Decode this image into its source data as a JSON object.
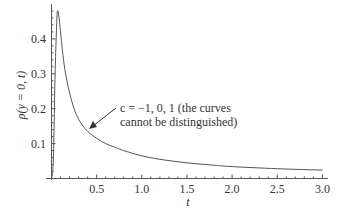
{
  "chart_data": {
    "type": "line",
    "title": "",
    "xlabel": "t",
    "ylabel": "ρ(y = 0, t)",
    "xlim": [
      0,
      3.0
    ],
    "ylim": [
      0,
      0.5
    ],
    "grid": false,
    "legend": null,
    "x_ticks": [
      "0.5",
      "1.0",
      "1.5",
      "2.0",
      "2.5",
      "3.0"
    ],
    "y_ticks": [
      "0.1",
      "0.2",
      "0.3",
      "0.4"
    ],
    "annotation": {
      "line1": "c = −1, 0, 1 (the curves",
      "line2": "cannot be distinguished)",
      "arrow_to": [
        0.4,
        0.14
      ]
    },
    "series": [
      {
        "name": "c = -1, 0, 1",
        "x": [
          0.0,
          0.02,
          0.04,
          0.06,
          0.07,
          0.08,
          0.1,
          0.12,
          0.15,
          0.2,
          0.25,
          0.3,
          0.35,
          0.4,
          0.5,
          0.6,
          0.7,
          0.8,
          1.0,
          1.2,
          1.5,
          1.8,
          2.0,
          2.5,
          3.0
        ],
        "values": [
          0.0,
          0.05,
          0.3,
          0.46,
          0.48,
          0.47,
          0.42,
          0.37,
          0.31,
          0.245,
          0.2,
          0.17,
          0.15,
          0.135,
          0.115,
          0.1,
          0.09,
          0.08,
          0.065,
          0.055,
          0.045,
          0.038,
          0.034,
          0.028,
          0.024
        ]
      }
    ]
  }
}
